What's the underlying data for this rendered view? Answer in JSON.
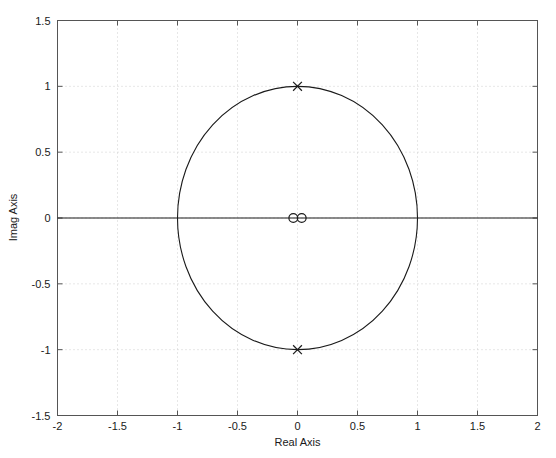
{
  "chart_data": {
    "type": "scatter",
    "title": "",
    "subtitle": "",
    "xlabel": "Real Axis",
    "ylabel": "Imag Axis",
    "xlim": [
      -2,
      2
    ],
    "ylim": [
      -1.5,
      1.5
    ],
    "xticks": [
      -2,
      -1.5,
      -1,
      -0.5,
      0,
      0.5,
      1,
      1.5,
      2
    ],
    "xticklabels": [
      "-2",
      "-1.5",
      "-1",
      "-0.5",
      "0",
      "0.5",
      "1",
      "1.5",
      "2"
    ],
    "yticks": [
      -1.5,
      -1,
      -0.5,
      0,
      0.5,
      1,
      1.5
    ],
    "yticklabels": [
      "-1.5",
      "-1",
      "-0.5",
      "0",
      "0.5",
      "1",
      "1.5"
    ],
    "grid": true,
    "grid_style": "dotted",
    "legend": null,
    "legend_position": "none",
    "series": [
      {
        "name": "zeros",
        "marker": "o",
        "points": [
          {
            "x": -0.035,
            "y": 0.0
          },
          {
            "x": 0.035,
            "y": 0.0
          }
        ]
      },
      {
        "name": "poles",
        "marker": "x",
        "points": [
          {
            "x": 0.0,
            "y": 1.0
          },
          {
            "x": 0.0,
            "y": -1.0
          }
        ]
      }
    ],
    "annotations": [
      {
        "name": "unit-circle",
        "type": "circle",
        "cx": 0,
        "cy": 0,
        "r": 1
      },
      {
        "name": "real-axis-line",
        "type": "hline",
        "y": 0
      }
    ],
    "colors": {
      "line": "#1a1a1a",
      "marker": "#1a1a1a",
      "grid": "#cfcfcf",
      "axis": "#4d4d4d",
      "background": "#ffffff"
    }
  },
  "axes": {
    "x_label": "Real Axis",
    "y_label": "Imag Axis"
  }
}
